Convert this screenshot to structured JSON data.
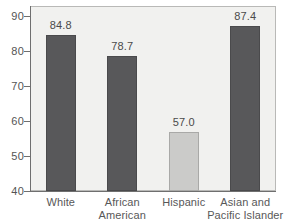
{
  "chart_data": {
    "type": "bar",
    "title": "",
    "subtitle": "",
    "xlabel": "",
    "ylabel": "",
    "categories": [
      "White",
      "African American",
      "Hispanic",
      "Asian and Pacific Islander"
    ],
    "category_lines": [
      [
        "White",
        ""
      ],
      [
        "African",
        "American"
      ],
      [
        "Hispanic",
        ""
      ],
      [
        "Asian and",
        "Pacific Islander"
      ]
    ],
    "values": [
      84.8,
      78.7,
      57.0,
      87.4
    ],
    "value_labels": [
      "84.8",
      "78.7",
      "57.0",
      "87.4"
    ],
    "ylim": [
      40,
      93
    ],
    "yticks": [
      40,
      50,
      60,
      70,
      80,
      90
    ],
    "ytick_labels": [
      "40",
      "50",
      "60",
      "70",
      "80",
      "90"
    ],
    "grid": false,
    "legend": "none",
    "bar_colors": [
      "#58585a",
      "#58585a",
      "#cbcbc9",
      "#58585a"
    ],
    "plot_background": "#f1f1ef",
    "axis_color": "#6f6f6f"
  }
}
